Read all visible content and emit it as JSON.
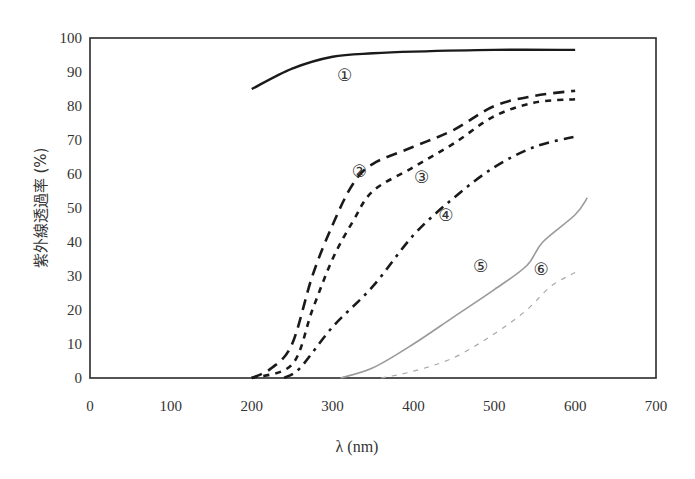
{
  "chart_data": {
    "type": "line",
    "title": "",
    "xlabel": "λ (nm)",
    "ylabel": "紫外線透過率 (%)",
    "xlim": [
      0,
      700
    ],
    "ylim": [
      0,
      100
    ],
    "xticks": [
      0,
      100,
      200,
      300,
      400,
      500,
      600,
      700
    ],
    "yticks": [
      0,
      10,
      20,
      30,
      40,
      50,
      60,
      70,
      80,
      90,
      100
    ],
    "grid": false,
    "legend": "inline circled-number markers",
    "series": [
      {
        "name": "①",
        "style": "solid",
        "color": "#1a1a1a",
        "width": 2.4,
        "x": [
          200,
          250,
          300,
          350,
          400,
          500,
          600
        ],
        "y": [
          85,
          91,
          94.5,
          95.5,
          96,
          96.5,
          96.5
        ],
        "label_pos": [
          315,
          89
        ]
      },
      {
        "name": "②",
        "style": "long-dash",
        "color": "#1a1a1a",
        "width": 2.6,
        "x": [
          200,
          225,
          250,
          275,
          300,
          325,
          350,
          400,
          450,
          500,
          550,
          600
        ],
        "y": [
          0,
          3,
          10,
          30,
          45,
          57,
          63,
          68,
          73,
          80,
          83,
          84.5
        ],
        "label_pos": [
          333,
          61
        ]
      },
      {
        "name": "③",
        "style": "short-dash",
        "color": "#1a1a1a",
        "width": 2.6,
        "x": [
          200,
          250,
          275,
          300,
          325,
          350,
          400,
          450,
          500,
          550,
          600
        ],
        "y": [
          0,
          4,
          20,
          35,
          46,
          55,
          62,
          69,
          77,
          81,
          82
        ],
        "label_pos": [
          410,
          59
        ]
      },
      {
        "name": "④",
        "style": "dash-dot",
        "color": "#1a1a1a",
        "width": 2.6,
        "x": [
          240,
          260,
          300,
          350,
          400,
          450,
          500,
          550,
          600
        ],
        "y": [
          0,
          3,
          15,
          27,
          42,
          53,
          62,
          68,
          71
        ],
        "label_pos": [
          440,
          48
        ]
      },
      {
        "name": "⑤",
        "style": "solid",
        "color": "#9a9a9a",
        "width": 1.6,
        "x": [
          310,
          350,
          400,
          450,
          500,
          540,
          560,
          600,
          615
        ],
        "y": [
          0,
          3,
          10,
          18,
          26,
          33,
          40,
          48,
          53
        ],
        "label_pos": [
          483,
          33
        ]
      },
      {
        "name": "⑥",
        "style": "dashed",
        "color": "#a8a8a8",
        "width": 1.2,
        "x": [
          360,
          400,
          450,
          500,
          540,
          570,
          600
        ],
        "y": [
          0,
          2,
          6,
          13,
          20,
          27,
          31
        ],
        "label_pos": [
          558,
          32
        ]
      }
    ]
  }
}
